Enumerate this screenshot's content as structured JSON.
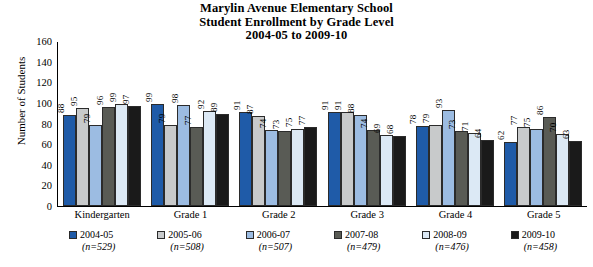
{
  "chart_data": {
    "type": "bar",
    "title": "Marylin Avenue Elementary School",
    "subtitle": "Student Enrollment by Grade Level",
    "subtitle2": "2004-05 to 2009-10",
    "xlabel": "",
    "ylabel": "Number of Students",
    "ylim": [
      0,
      160
    ],
    "yticks": [
      160,
      140,
      120,
      100,
      80,
      60,
      40,
      20,
      0
    ],
    "grid": false,
    "legend_position": "bottom",
    "categories": [
      "Kindergarten",
      "Grade 1",
      "Grade 2",
      "Grade 3",
      "Grade 4",
      "Grade 5"
    ],
    "series": [
      {
        "name": "2004-05",
        "n": "(n=529)",
        "color": "#1f5ba8",
        "values": [
          88,
          99,
          91,
          91,
          78,
          62
        ]
      },
      {
        "name": "2005-06",
        "n": "(n=508)",
        "color": "#c8cacb",
        "values": [
          95,
          79,
          87,
          91,
          79,
          77
        ]
      },
      {
        "name": "2006-07",
        "n": "(n=507)",
        "color": "#9cbce2",
        "values": [
          79,
          98,
          74,
          88,
          93,
          75
        ]
      },
      {
        "name": "2007-08",
        "n": "(n=479)",
        "color": "#595b55",
        "values": [
          96,
          77,
          73,
          74,
          73,
          86
        ]
      },
      {
        "name": "2008-09",
        "n": "(n=476)",
        "color": "#dce9f5",
        "values": [
          99,
          92,
          75,
          69,
          71,
          70
        ]
      },
      {
        "name": "2009-10",
        "n": "(n=458)",
        "color": "#1a1a1a",
        "values": [
          97,
          89,
          77,
          68,
          64,
          63
        ]
      }
    ]
  }
}
